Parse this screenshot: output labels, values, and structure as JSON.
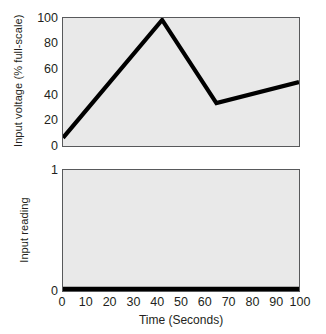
{
  "chart_data": [
    {
      "id": "input-voltage-panel",
      "type": "line",
      "title": "",
      "xlabel": "Time (Seconds)",
      "ylabel": "Input voltage (% full-scale)",
      "xlim": [
        0,
        100
      ],
      "ylim": [
        0,
        100
      ],
      "xticks": [
        0,
        10,
        20,
        30,
        40,
        50,
        60,
        70,
        80,
        90,
        100
      ],
      "xtick_labels": [
        "0",
        "10",
        "20",
        "30",
        "40",
        "50",
        "60",
        "70",
        "80",
        "90",
        "100"
      ],
      "yticks": [
        0,
        20,
        40,
        60,
        80,
        100
      ],
      "ytick_labels": [
        "0",
        "20",
        "40",
        "60",
        "80",
        "100"
      ],
      "grid": false,
      "legend": "none",
      "series": [
        {
          "name": "Input voltage",
          "color": "#000000",
          "x": [
            0,
            42,
            65,
            100
          ],
          "values": [
            5,
            100,
            33,
            50
          ]
        }
      ]
    },
    {
      "id": "input-reading-panel",
      "type": "line",
      "title": "",
      "xlabel": "Time (Seconds)",
      "ylabel": "Input reading",
      "xlim": [
        0,
        100
      ],
      "ylim": [
        0,
        1
      ],
      "xticks": [
        0,
        10,
        20,
        30,
        40,
        50,
        60,
        70,
        80,
        90,
        100
      ],
      "xtick_labels": [
        "0",
        "10",
        "20",
        "30",
        "40",
        "50",
        "60",
        "70",
        "80",
        "90",
        "100"
      ],
      "yticks": [
        0,
        1
      ],
      "ytick_labels": [
        "0",
        "1"
      ],
      "grid": false,
      "legend": "none",
      "series": [
        {
          "name": "Input reading",
          "color": "#000000",
          "x": [
            0,
            100
          ],
          "values": [
            0,
            0
          ]
        }
      ]
    }
  ],
  "figure": {
    "xaxis_title": "Time (Seconds)",
    "xtick_labels": [
      "0",
      "10",
      "20",
      "30",
      "40",
      "50",
      "60",
      "70",
      "80",
      "90",
      "100"
    ],
    "top_panel": {
      "yaxis_title": "Input voltage (% full-scale)",
      "ytick_labels": [
        "100",
        "80",
        "60",
        "40",
        "20",
        "0"
      ]
    },
    "bottom_panel": {
      "yaxis_title": "Input reading",
      "ytick_labels": [
        "1",
        "0"
      ]
    },
    "colors": {
      "plot_background": "#e9e9e9",
      "plot_border": "#58595b",
      "line": "#000000",
      "text": "#231f20",
      "page_background": "#ffffff"
    }
  }
}
